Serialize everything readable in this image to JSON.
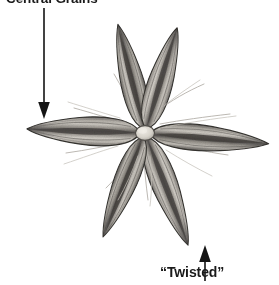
{
  "figure": {
    "kind": "botanical-specimen-illustration",
    "background_color": "#ffffff",
    "width": 279,
    "height": 285
  },
  "annotations": {
    "top": {
      "label": "Central Grains",
      "arrow_direction": "down",
      "arrow_x": 44,
      "arrow_y_start": 8,
      "arrow_y_end": 118,
      "points_to": "central-grain-lobe-surface"
    },
    "bottom": {
      "label": "“Twisted”",
      "arrow_direction": "up",
      "arrow_x": 205,
      "arrow_y_start": 281,
      "arrow_y_end": 246,
      "points_to": "lower-right-lobe-tip"
    }
  },
  "specimen": {
    "center": {
      "name": "central-ovule",
      "cx": 145,
      "cy": 133,
      "rx": 9,
      "ry": 7,
      "fill": "#d8d4cc"
    },
    "lobe_count": 6,
    "lobes": [
      {
        "name": "lobe-left",
        "angle": 182,
        "length": 118,
        "width": 31
      },
      {
        "name": "lobe-upper-left",
        "angle": 256,
        "length": 112,
        "width": 27
      },
      {
        "name": "lobe-upper-right",
        "angle": 287,
        "length": 110,
        "width": 27
      },
      {
        "name": "lobe-right",
        "angle": 5,
        "length": 124,
        "width": 30
      },
      {
        "name": "lobe-lower-right",
        "angle": 69,
        "length": 120,
        "width": 28
      },
      {
        "name": "lobe-lower-left",
        "angle": 112,
        "length": 112,
        "width": 27
      }
    ],
    "palette": {
      "lobe_light": "#cdc9c2",
      "lobe_mid": "#9a9690",
      "lobe_dark": "#5d5a56",
      "lobe_edge": "#3a3835",
      "grain_stripe": "#4a4744",
      "hair": "#b9b5ae",
      "arrow": "#141414"
    }
  }
}
